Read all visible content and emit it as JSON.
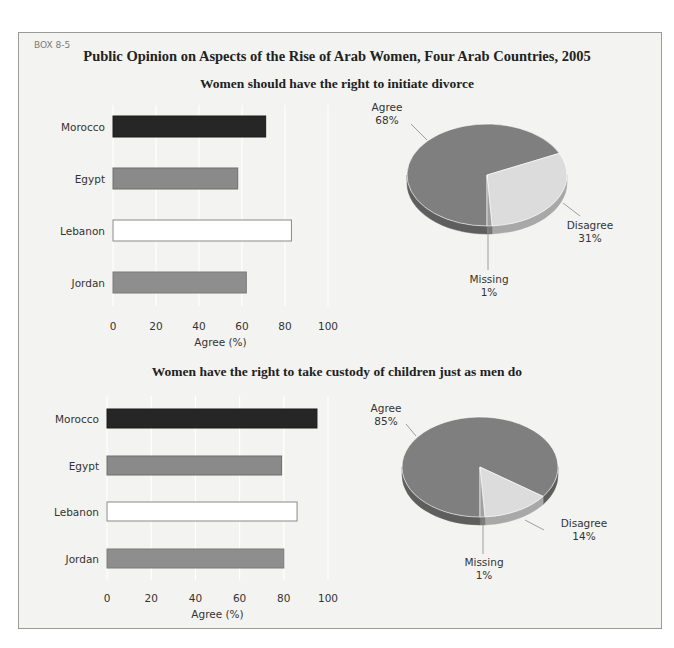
{
  "box_label": "BOX 8-5",
  "title": "Public Opinion on Aspects of the Rise of Arab Women, Four Arab Countries, 2005",
  "panels": [
    {
      "subtitle": "Women should have the right to initiate divorce",
      "xlabel": "Agree (%)",
      "ticks": [
        "0",
        "20",
        "40",
        "60",
        "80",
        "100"
      ],
      "countries": [
        "Morocco",
        "Egypt",
        "Lebanon",
        "Jordan"
      ],
      "pie_labels": {
        "agree": "Agree",
        "agree_pct": "68%",
        "disagree": "Disagree",
        "disagree_pct": "31%",
        "missing": "Missing",
        "missing_pct": "1%"
      }
    },
    {
      "subtitle": "Women have the right to take custody of children just as men do",
      "xlabel": "Agree (%)",
      "ticks": [
        "0",
        "20",
        "40",
        "60",
        "80",
        "100"
      ],
      "countries": [
        "Morocco",
        "Egypt",
        "Lebanon",
        "Jordan"
      ],
      "pie_labels": {
        "agree": "Agree",
        "agree_pct": "85%",
        "disagree": "Disagree",
        "disagree_pct": "14%",
        "missing": "Missing",
        "missing_pct": "1%"
      }
    }
  ],
  "colors": {
    "morocco": "#262626",
    "egypt": "#8a8a8a",
    "lebanon": "#ffffff",
    "jordan": "#8e8e8e",
    "agree": "#7f7f7f",
    "disagree": "#dcdcdc",
    "missing": "#a0a0a0"
  },
  "chart_data": [
    {
      "type": "bar",
      "title": "Women should have the right to initiate divorce",
      "orientation": "horizontal",
      "categories": [
        "Morocco",
        "Egypt",
        "Lebanon",
        "Jordan"
      ],
      "values": [
        71,
        58,
        83,
        62
      ],
      "xlabel": "Agree (%)",
      "ylabel": "",
      "xlim": [
        0,
        100
      ],
      "xticks": [
        0,
        20,
        40,
        60,
        80,
        100
      ],
      "grid": true
    },
    {
      "type": "pie",
      "title": "Women should have the right to initiate divorce",
      "categories": [
        "Agree",
        "Disagree",
        "Missing"
      ],
      "values": [
        68,
        31,
        1
      ]
    },
    {
      "type": "bar",
      "title": "Women have the right to take custody of children just as men do",
      "orientation": "horizontal",
      "categories": [
        "Morocco",
        "Egypt",
        "Lebanon",
        "Jordan"
      ],
      "values": [
        95,
        79,
        86,
        80
      ],
      "xlabel": "Agree (%)",
      "ylabel": "",
      "xlim": [
        0,
        100
      ],
      "xticks": [
        0,
        20,
        40,
        60,
        80,
        100
      ],
      "grid": true
    },
    {
      "type": "pie",
      "title": "Women have the right to take custody of children just as men do",
      "categories": [
        "Agree",
        "Disagree",
        "Missing"
      ],
      "values": [
        85,
        14,
        1
      ]
    }
  ]
}
